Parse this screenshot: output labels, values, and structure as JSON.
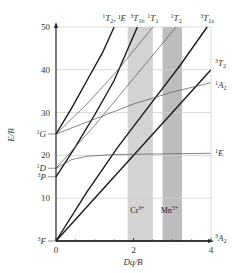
{
  "chart_data": {
    "type": "line",
    "title": "",
    "xlabel": "Dq/B",
    "ylabel": "E/B",
    "xlim": [
      0,
      4
    ],
    "ylim": [
      0,
      50
    ],
    "x_ticks": [
      "0",
      "2",
      "4"
    ],
    "x_tick_values": [
      0,
      2,
      4
    ],
    "y_ticks": [
      "10",
      "20",
      "30",
      "40",
      "50"
    ],
    "y_tick_values": [
      10,
      20,
      30,
      40,
      50
    ],
    "grid": "horizontal",
    "free_ion_terms": [
      {
        "sup": "3",
        "term": "F",
        "value": 0
      },
      {
        "sup": "3",
        "term": "P",
        "value": 15
      },
      {
        "sup": "1",
        "term": "D",
        "value": 17
      },
      {
        "sup": "1",
        "term": "G",
        "value": 25
      }
    ],
    "bands": [
      {
        "name": "Cr3+",
        "label": "Cr",
        "charge": "3+",
        "x_range": [
          1.85,
          2.5
        ],
        "color": "#d3d3d3"
      },
      {
        "name": "Mn5+",
        "label": "Mn",
        "charge": "5+",
        "x_range": [
          2.75,
          3.25
        ],
        "color": "#bdbdbd"
      }
    ],
    "series": [
      {
        "name": "3A2",
        "sup": "3",
        "term": "A",
        "sub": "2",
        "weight": "bold",
        "points": [
          [
            0,
            0
          ],
          [
            4,
            0
          ]
        ],
        "label_pos": "right"
      },
      {
        "name": "3T2",
        "sup": "3",
        "term": "T",
        "sub": "2",
        "weight": "bold",
        "points": [
          [
            0,
            0
          ],
          [
            4,
            40
          ]
        ],
        "label_pos": "right"
      },
      {
        "name": "3T1a",
        "sup": "3",
        "term": "T",
        "sub": "1a",
        "weight": "bold",
        "points": [
          [
            0,
            0
          ],
          [
            0.8,
            11.5
          ],
          [
            1.6,
            22
          ],
          [
            2.4,
            31.5
          ],
          [
            3.2,
            41
          ],
          [
            3.9,
            50
          ]
        ],
        "label_pos": "top"
      },
      {
        "name": "3T1b",
        "sup": "3",
        "term": "T",
        "sub": "1b",
        "weight": "bold",
        "points": [
          [
            0,
            15
          ],
          [
            0.5,
            22
          ],
          [
            1.0,
            29.5
          ],
          [
            1.5,
            37.5
          ],
          [
            2.1,
            50
          ]
        ],
        "label_pos": "top"
      },
      {
        "name": "1E",
        "sup": "1",
        "term": "E",
        "sub": "",
        "weight": "thin",
        "points": [
          [
            0,
            17
          ],
          [
            0.4,
            19
          ],
          [
            0.8,
            19.8
          ],
          [
            1.5,
            20.2
          ],
          [
            4,
            20.5
          ]
        ],
        "label_pos": "right"
      },
      {
        "name": "1A2",
        "sup": "1",
        "term": "A",
        "sub": "2",
        "weight": "thin",
        "points": [
          [
            0,
            25
          ],
          [
            1,
            28.5
          ],
          [
            2,
            32
          ],
          [
            3,
            34.8
          ],
          [
            4,
            37
          ]
        ],
        "label_pos": "right"
      },
      {
        "name": "1T1",
        "sup": "1",
        "term": "T",
        "sub": "1",
        "weight": "thin",
        "points": [
          [
            0,
            25
          ],
          [
            0.8,
            32
          ],
          [
            1.6,
            40
          ],
          [
            2.5,
            50
          ]
        ],
        "label_pos": "top"
      },
      {
        "name": "1T2",
        "sup": "1",
        "term": "T",
        "sub": "2",
        "weight": "thin",
        "points": [
          [
            0,
            17
          ],
          [
            1,
            27
          ],
          [
            2,
            38
          ],
          [
            3.1,
            50
          ]
        ],
        "label_pos": "top"
      },
      {
        "name": "1T2,1E",
        "sup": "1",
        "term": "T",
        "sub": "2",
        "extra": ", ¹E",
        "weight": "bold",
        "points": [
          [
            0,
            25
          ],
          [
            0.4,
            31
          ],
          [
            0.8,
            37.5
          ],
          [
            1.2,
            44
          ],
          [
            1.5,
            50
          ]
        ],
        "label_pos": "top"
      }
    ]
  }
}
